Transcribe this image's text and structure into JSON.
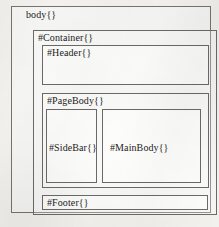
{
  "diagram": {
    "type": "nested-box-layout-diagram",
    "boxes": {
      "body": {
        "label": "body{}"
      },
      "container": {
        "label": "#Container{}"
      },
      "header": {
        "label": "#Header{}"
      },
      "page_body": {
        "label": "#PageBody{}"
      },
      "side_bar": {
        "label": "#SideBar{}"
      },
      "main_body": {
        "label": "#MainBody{}"
      },
      "footer": {
        "label": "#Footer{}"
      }
    }
  },
  "colors": {
    "page_background": "#f3f2ef",
    "border": "#6c6a68",
    "text": "#1d1c1b"
  }
}
